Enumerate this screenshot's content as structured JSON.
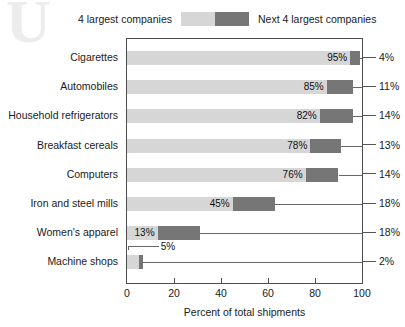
{
  "legend": {
    "left_label": "4 largest companies",
    "right_label": "Next 4 largest companies",
    "light_color": "#d6d6d6",
    "dark_color": "#767676"
  },
  "axis": {
    "x_title": "Percent of total shipments",
    "ticks": [
      "0",
      "20",
      "40",
      "60",
      "80",
      "100"
    ]
  },
  "chart_data": {
    "type": "bar",
    "orientation": "horizontal",
    "stacked": true,
    "title": "",
    "subtitle": "",
    "xlabel": "Percent of total shipments",
    "ylabel": "",
    "xlim": [
      0,
      100
    ],
    "xticks": [
      0,
      20,
      40,
      60,
      80,
      100
    ],
    "grid": false,
    "legend_position": "top",
    "categories": [
      "Cigarettes",
      "Automobiles",
      "Household refrigerators",
      "Breakfast cereals",
      "Computers",
      "Iron and steel mills",
      "Women's apparel",
      "Machine shops"
    ],
    "series": [
      {
        "name": "4 largest companies",
        "color": "#d6d6d6",
        "values": [
          95,
          85,
          82,
          78,
          76,
          45,
          13,
          5
        ]
      },
      {
        "name": "Next 4 largest companies",
        "color": "#767676",
        "values": [
          4,
          11,
          14,
          13,
          14,
          18,
          18,
          2
        ]
      }
    ],
    "bar_labels_inside": [
      "95%",
      "85%",
      "82%",
      "78%",
      "76%",
      "45%",
      "13%",
      "5%"
    ],
    "bar_labels_right": [
      "4%",
      "11%",
      "14%",
      "13%",
      "14%",
      "18%",
      "18%",
      "2%"
    ]
  },
  "watermark": "U"
}
